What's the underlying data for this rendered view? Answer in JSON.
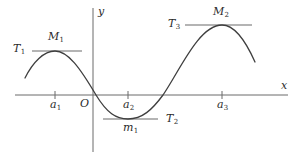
{
  "figure": {
    "type": "function-graph-extrema-diagram",
    "colors": {
      "curve": "#3f3f3f",
      "axis": "#6b6b6b",
      "tangent": "#6b6b6b",
      "text": "#2b2b2b",
      "background": "#ffffff"
    }
  },
  "axes": {
    "x_label": "x",
    "y_label": "y",
    "origin_label": "O",
    "x_axis": {
      "y": 95,
      "x_start": 15,
      "x_end": 288
    },
    "y_axis": {
      "x": 93,
      "y_start": 8,
      "y_end": 152
    },
    "ticks": [
      {
        "name": "a1",
        "label": "a",
        "sub": "1",
        "x": 55
      },
      {
        "name": "a2",
        "label": "a",
        "sub": "2",
        "x": 128
      },
      {
        "name": "a3",
        "label": "a",
        "sub": "3",
        "x": 222
      }
    ]
  },
  "extrema": [
    {
      "kind": "local-maximum",
      "point_label": "M",
      "point_sub": "1",
      "tangent_label": "T",
      "tangent_sub": "1",
      "at_tick": "a1",
      "x": 55,
      "y": 51
    },
    {
      "kind": "local-minimum",
      "point_label": "m",
      "point_sub": "1",
      "tangent_label": "T",
      "tangent_sub": "2",
      "at_tick": "a2",
      "x": 128,
      "y": 119
    },
    {
      "kind": "local-maximum",
      "point_label": "M",
      "point_sub": "2",
      "tangent_label": "T",
      "tangent_sub": "3",
      "at_tick": "a3",
      "x": 222,
      "y": 25
    }
  ],
  "labels": {
    "M1": "M",
    "M1_sub": "1",
    "m1": "m",
    "m1_sub": "1",
    "M2": "M",
    "M2_sub": "2",
    "T1": "T",
    "T1_sub": "1",
    "T2": "T",
    "T2_sub": "2",
    "T3": "T",
    "T3_sub": "3",
    "a1": "a",
    "a1_sub": "1",
    "a2": "a",
    "a2_sub": "2",
    "a3": "a",
    "a3_sub": "3",
    "x": "x",
    "y": "y",
    "O": "O"
  },
  "curve": {
    "description": "smooth wave rising to maximum M1 at a1, falling through zero to minimum m1 at a2, rising through zero to maximum M2 at a3, then falling",
    "zero_crossings": [
      96,
      163
    ],
    "start_point": {
      "x": 25,
      "y": 78
    },
    "end_point": {
      "x": 255,
      "y": 62
    }
  },
  "tangent_lines": [
    {
      "name": "tangent-at-M1",
      "y": 51,
      "x_start": 32,
      "x_end": 82
    },
    {
      "name": "tangent-at-m1",
      "y": 119,
      "x_start": 103,
      "x_end": 158
    },
    {
      "name": "tangent-at-M2",
      "y": 25,
      "x_start": 185,
      "x_end": 252
    }
  ]
}
